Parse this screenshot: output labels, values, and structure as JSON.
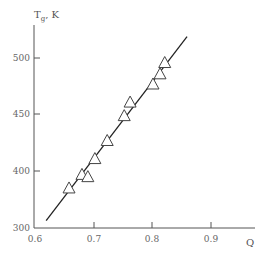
{
  "chart_data": {
    "type": "scatter",
    "title": "",
    "xlabel": "Q",
    "ylabel": "Tg, K",
    "ylabel_main": "T",
    "ylabel_sub": "g",
    "ylabel_suffix": ", K",
    "xlim": [
      0.6,
      0.97
    ],
    "ylim": [
      300,
      530
    ],
    "x_ticks": [
      0.6,
      0.7,
      0.8,
      0.9
    ],
    "x_tick_labels": [
      "0.6",
      "0.7",
      "0.8",
      "0.9"
    ],
    "y_ticks": [
      300,
      400,
      450,
      500
    ],
    "y_tick_labels": [
      "300",
      "400",
      "450",
      "500"
    ],
    "y_axis_break_note": "origin labeled 300; scale between 300 and 400 compressed",
    "grid": false,
    "legend": null,
    "series": [
      {
        "name": "measured",
        "marker": "open-triangle",
        "points": [
          {
            "x": 0.658,
            "y": 385
          },
          {
            "x": 0.68,
            "y": 397
          },
          {
            "x": 0.69,
            "y": 395
          },
          {
            "x": 0.702,
            "y": 411
          },
          {
            "x": 0.723,
            "y": 427
          },
          {
            "x": 0.752,
            "y": 449
          },
          {
            "x": 0.762,
            "y": 461
          },
          {
            "x": 0.801,
            "y": 477
          },
          {
            "x": 0.813,
            "y": 486
          },
          {
            "x": 0.821,
            "y": 496
          }
        ]
      },
      {
        "name": "fit",
        "type": "line",
        "points": [
          {
            "x": 0.619,
            "y": 356
          },
          {
            "x": 0.859,
            "y": 519
          }
        ]
      }
    ]
  }
}
